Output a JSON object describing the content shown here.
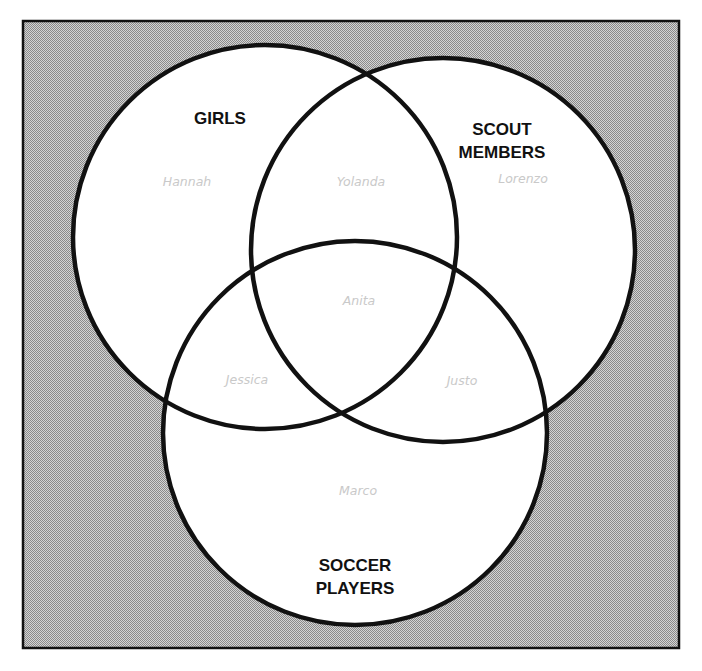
{
  "diagram": {
    "type": "venn",
    "colors": {
      "background_pattern_dark": "#8f8f8f",
      "background_pattern_light": "#d4d4d4",
      "circle_fill": "#ffffff",
      "outline": "#111111",
      "set_label": "#111111",
      "member_label": "#c9c9c9"
    },
    "sets": [
      {
        "id": "girls",
        "label_lines": [
          "GIRLS"
        ]
      },
      {
        "id": "scout",
        "label_lines": [
          "SCOUT",
          "MEMBERS"
        ]
      },
      {
        "id": "soccer",
        "label_lines": [
          "SOCCER",
          "PLAYERS"
        ]
      }
    ],
    "regions": [
      {
        "sets": [
          "girls"
        ],
        "name": "Hannah"
      },
      {
        "sets": [
          "girls",
          "scout"
        ],
        "name": "Yolanda"
      },
      {
        "sets": [
          "scout"
        ],
        "name": "Lorenzo"
      },
      {
        "sets": [
          "girls",
          "scout",
          "soccer"
        ],
        "name": "Anita"
      },
      {
        "sets": [
          "girls",
          "soccer"
        ],
        "name": "Jessica"
      },
      {
        "sets": [
          "scout",
          "soccer"
        ],
        "name": "Justo"
      },
      {
        "sets": [
          "soccer"
        ],
        "name": "Marco"
      }
    ]
  }
}
